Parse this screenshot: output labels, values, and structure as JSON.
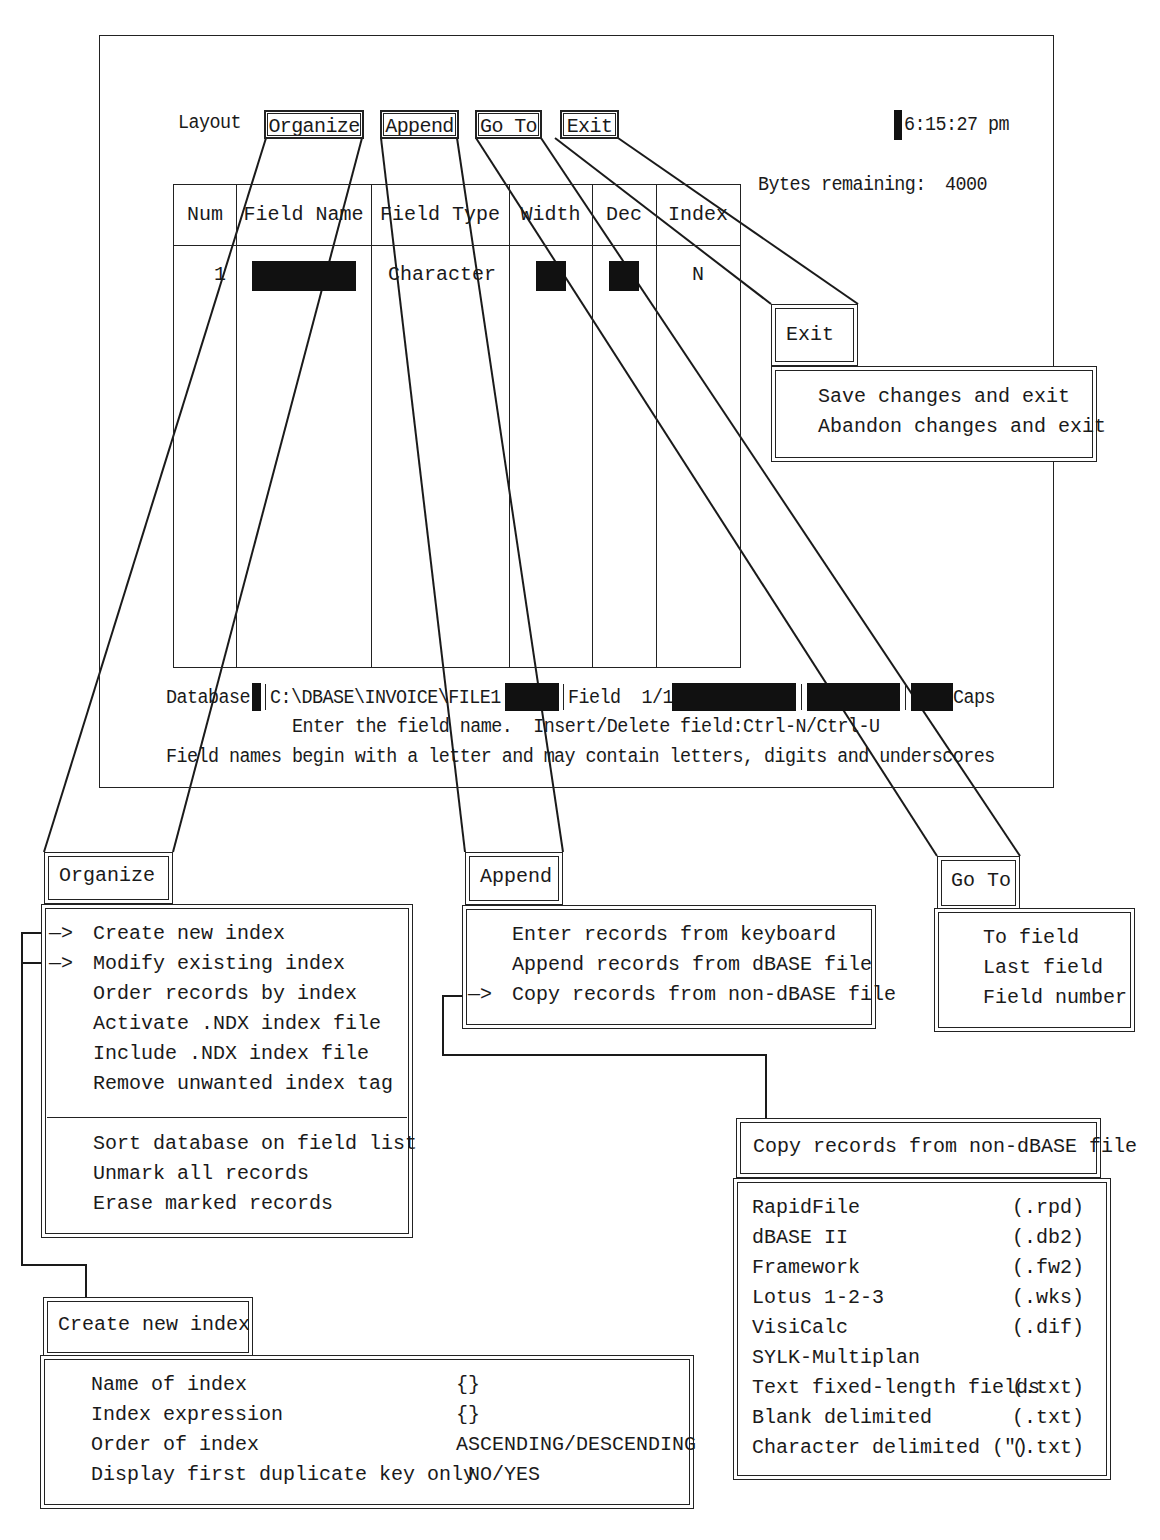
{
  "menu_bar": {
    "layout_label": "Layout",
    "items": [
      {
        "label": "Organize"
      },
      {
        "label": "Append"
      },
      {
        "label": "Go To"
      },
      {
        "label": "Exit"
      }
    ],
    "clock": "6:15:27 pm"
  },
  "bytes_remaining": {
    "label": "Bytes remaining:",
    "value": "4000"
  },
  "field_table": {
    "columns": [
      "Num",
      "Field Name",
      "Field Type",
      "Width",
      "Dec",
      "Index"
    ],
    "rows": [
      {
        "num": "1",
        "field_name": "",
        "field_type": "Character",
        "width": "",
        "dec": "",
        "index": "N"
      }
    ]
  },
  "status_bar": {
    "database_label": "Database",
    "path": "C:\\DBASE\\INVOICE\\FILE1",
    "field_position": "Field  1/1",
    "caps": "Caps"
  },
  "messages": {
    "line1": "Enter the field name.  Insert/Delete field:Ctrl-N/Ctrl-U",
    "line2": "Field names begin with a letter and may contain letters, digits and underscores"
  },
  "popups": {
    "exit": {
      "title": "Exit",
      "items": [
        "Save changes and exit",
        "Abandon changes and exit"
      ]
    },
    "organize": {
      "title": "Organize",
      "arrow": "—>",
      "items": [
        {
          "label": "Create new index",
          "arrow": true
        },
        {
          "label": "Modify existing index",
          "arrow": true
        },
        {
          "label": "Order records by index",
          "arrow": false
        },
        {
          "label": "Activate .NDX index file",
          "arrow": false
        },
        {
          "label": "Include .NDX index file",
          "arrow": false
        },
        {
          "label": "Remove unwanted index tag",
          "arrow": false
        }
      ],
      "items2": [
        {
          "label": "Sort database on field list"
        },
        {
          "label": "Unmark all records"
        },
        {
          "label": "Erase marked records"
        }
      ]
    },
    "append": {
      "title": "Append",
      "items": [
        {
          "label": "Enter records from keyboard",
          "arrow": false
        },
        {
          "label": "Append records from dBASE file",
          "arrow": false
        },
        {
          "label": "Copy records from non-dBASE file",
          "arrow": true
        }
      ]
    },
    "goto": {
      "title": "Go To",
      "items": [
        "To field",
        "Last field",
        "Field number"
      ]
    },
    "copy_records": {
      "title": "Copy records from non-dBASE file",
      "items": [
        {
          "name": "RapidFile",
          "ext": "(.rpd)"
        },
        {
          "name": "dBASE II",
          "ext": "(.db2)"
        },
        {
          "name": "Framework",
          "ext": "(.fw2)"
        },
        {
          "name": "Lotus 1-2-3",
          "ext": "(.wks)"
        },
        {
          "name": "VisiCalc",
          "ext": "(.dif)"
        },
        {
          "name": "SYLK-Multiplan",
          "ext": ""
        },
        {
          "name": "Text fixed-length fields",
          "ext": "(.txt)"
        },
        {
          "name": "Blank delimited",
          "ext": "(.txt)"
        },
        {
          "name": "Character delimited (\")",
          "ext": "(.txt)"
        }
      ]
    },
    "create_index": {
      "title": "Create new index",
      "fields": [
        {
          "label": "Name of index",
          "value": "{}"
        },
        {
          "label": "Index expression",
          "value": "{}"
        },
        {
          "label": "Order of index",
          "value": "ASCENDING/DESCENDING"
        },
        {
          "label": "Display first duplicate key only",
          "value": " NO/YES"
        }
      ]
    }
  }
}
